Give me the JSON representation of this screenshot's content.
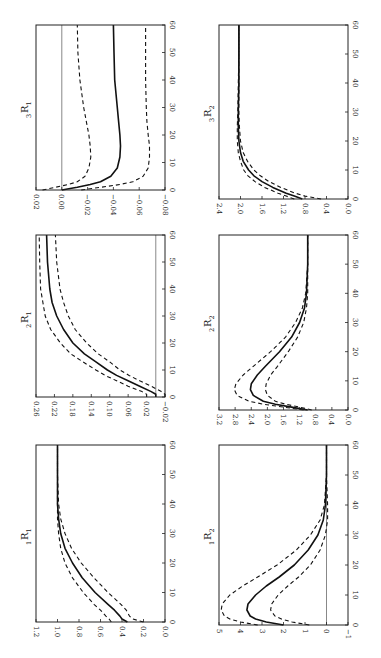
{
  "figure": {
    "orientation": "rotated 90 degrees counterclockwise",
    "colors": {
      "line": "#111111",
      "frame": "#222222",
      "background": "#ffffff",
      "reference_line": "#555555"
    },
    "line_styles": {
      "point_estimate": "solid",
      "confidence_band": "dashed"
    }
  },
  "chart_data": [
    {
      "id": "3R1",
      "title": "R",
      "title_prefix": "3",
      "title_suffix": "1",
      "type": "line",
      "xlabel": "",
      "ylabel": "",
      "x_ticks": [
        0,
        10,
        20,
        30,
        40,
        50,
        60
      ],
      "xlim": [
        0,
        60
      ],
      "y_ticks": [
        0.02,
        0.0,
        -0.02,
        -0.04,
        -0.06,
        -0.08
      ],
      "ylim": [
        -0.08,
        0.02
      ],
      "reference_line": 0.0,
      "x": [
        0,
        1,
        2,
        3,
        5,
        8,
        12,
        16,
        20,
        25,
        30,
        40,
        50,
        60
      ],
      "series": [
        {
          "name": "estimate",
          "style": "solid",
          "values": [
            0.0,
            -0.012,
            -0.022,
            -0.03,
            -0.038,
            -0.043,
            -0.045,
            -0.0455,
            -0.045,
            -0.044,
            -0.043,
            -0.041,
            -0.0405,
            -0.04
          ]
        },
        {
          "name": "upper",
          "style": "dashed",
          "values": [
            0.015,
            0.005,
            -0.005,
            -0.012,
            -0.018,
            -0.021,
            -0.0225,
            -0.022,
            -0.021,
            -0.019,
            -0.017,
            -0.014,
            -0.0125,
            -0.012
          ]
        },
        {
          "name": "lower",
          "style": "dashed",
          "values": [
            -0.015,
            -0.03,
            -0.045,
            -0.055,
            -0.063,
            -0.067,
            -0.068,
            -0.068,
            -0.067,
            -0.066,
            -0.0655,
            -0.065,
            -0.065,
            -0.065
          ]
        }
      ]
    },
    {
      "id": "2R1",
      "title": "R",
      "title_prefix": "2",
      "title_suffix": "1",
      "type": "line",
      "xlabel": "",
      "ylabel": "",
      "x_ticks": [
        0,
        10,
        20,
        30,
        40,
        50,
        60
      ],
      "xlim": [
        0,
        60
      ],
      "y_ticks": [
        0.26,
        0.22,
        0.18,
        0.14,
        0.1,
        0.06,
        0.02,
        -0.02
      ],
      "ylim": [
        -0.02,
        0.26
      ],
      "reference_line": 0.0,
      "x": [
        0,
        1,
        2,
        4,
        6,
        8,
        10,
        13,
        16,
        20,
        25,
        30,
        35,
        40,
        50,
        60
      ],
      "series": [
        {
          "name": "estimate",
          "style": "solid",
          "values": [
            0.0,
            0.0,
            0.01,
            0.035,
            0.06,
            0.085,
            0.105,
            0.13,
            0.155,
            0.18,
            0.2,
            0.215,
            0.225,
            0.23,
            0.235,
            0.237
          ]
        },
        {
          "name": "upper",
          "style": "dashed",
          "values": [
            0.02,
            0.02,
            0.03,
            0.06,
            0.085,
            0.11,
            0.13,
            0.158,
            0.185,
            0.207,
            0.228,
            0.24,
            0.245,
            0.25,
            0.252,
            0.253
          ]
        },
        {
          "name": "lower",
          "style": "dashed",
          "values": [
            -0.02,
            -0.02,
            -0.012,
            0.01,
            0.035,
            0.058,
            0.078,
            0.1,
            0.125,
            0.15,
            0.175,
            0.19,
            0.2,
            0.208,
            0.215,
            0.218
          ]
        }
      ]
    },
    {
      "id": "1R1",
      "title": "R",
      "title_prefix": "1",
      "title_suffix": "1",
      "type": "line",
      "xlabel": "",
      "ylabel": "",
      "x_ticks": [
        0,
        10,
        20,
        30,
        40,
        50,
        60
      ],
      "xlim": [
        0,
        60
      ],
      "y_ticks": [
        1.2,
        1.0,
        0.8,
        0.6,
        0.4,
        0.2,
        0.0
      ],
      "ylim": [
        0.0,
        1.2
      ],
      "x": [
        0,
        1,
        2,
        4,
        6,
        10,
        15,
        20,
        25,
        30,
        35,
        40,
        50,
        60
      ],
      "series": [
        {
          "name": "estimate",
          "style": "solid",
          "values": [
            0.35,
            0.4,
            0.42,
            0.47,
            0.53,
            0.65,
            0.77,
            0.86,
            0.93,
            0.97,
            0.99,
            1.0,
            1.0,
            1.0
          ]
        },
        {
          "name": "upper",
          "style": "dashed",
          "values": [
            0.5,
            0.52,
            0.55,
            0.6,
            0.66,
            0.76,
            0.86,
            0.93,
            0.97,
            0.99,
            1.0,
            1.0,
            1.0,
            1.0
          ]
        },
        {
          "name": "lower",
          "style": "dashed",
          "values": [
            0.2,
            0.3,
            0.33,
            0.36,
            0.41,
            0.53,
            0.66,
            0.78,
            0.87,
            0.93,
            0.97,
            0.99,
            1.0,
            1.0
          ]
        }
      ]
    },
    {
      "id": "3R2",
      "title": "R",
      "title_prefix": "3",
      "title_suffix": "2",
      "type": "line",
      "xlabel": "",
      "ylabel": "",
      "x_ticks": [
        0,
        10,
        20,
        30,
        40,
        50,
        60
      ],
      "xlim": [
        0,
        60
      ],
      "y_ticks": [
        2.4,
        2.0,
        1.6,
        1.2,
        0.8,
        0.4,
        0.0
      ],
      "ylim": [
        0.0,
        2.4
      ],
      "x": [
        0,
        1,
        2,
        4,
        6,
        8,
        10,
        13,
        16,
        20,
        25,
        30,
        40,
        50,
        60
      ],
      "series": [
        {
          "name": "estimate",
          "style": "solid",
          "values": [
            0.85,
            1.0,
            1.15,
            1.4,
            1.6,
            1.75,
            1.85,
            1.95,
            2.0,
            2.03,
            2.04,
            2.04,
            2.03,
            2.03,
            2.03
          ]
        },
        {
          "name": "upper",
          "style": "dashed",
          "values": [
            1.0,
            1.15,
            1.3,
            1.55,
            1.73,
            1.86,
            1.94,
            2.0,
            2.04,
            2.06,
            2.06,
            2.05,
            2.04,
            2.03,
            2.03
          ]
        },
        {
          "name": "lower",
          "style": "dashed",
          "values": [
            0.5,
            0.8,
            0.98,
            1.25,
            1.47,
            1.63,
            1.75,
            1.87,
            1.95,
            2.0,
            2.02,
            2.03,
            2.03,
            2.03,
            2.03
          ]
        }
      ]
    },
    {
      "id": "2R2",
      "title": "R",
      "title_prefix": "2",
      "title_suffix": "2",
      "type": "line",
      "xlabel": "",
      "ylabel": "",
      "x_ticks": [
        0,
        10,
        20,
        30,
        40,
        50,
        60
      ],
      "xlim": [
        0,
        60
      ],
      "y_ticks": [
        3.2,
        2.8,
        2.4,
        2.0,
        1.6,
        1.2,
        0.8,
        0.4,
        0.0
      ],
      "ylim": [
        0.0,
        3.2
      ],
      "x": [
        0,
        1,
        2,
        3,
        5,
        7,
        9,
        12,
        15,
        20,
        25,
        30,
        35,
        40,
        50,
        60
      ],
      "series": [
        {
          "name": "estimate",
          "style": "solid",
          "values": [
            1.0,
            1.4,
            1.8,
            2.1,
            2.35,
            2.42,
            2.4,
            2.25,
            2.05,
            1.7,
            1.4,
            1.2,
            1.08,
            1.03,
            1.0,
            1.0
          ]
        },
        {
          "name": "upper",
          "style": "dashed",
          "values": [
            1.1,
            1.6,
            2.1,
            2.45,
            2.75,
            2.82,
            2.78,
            2.6,
            2.35,
            1.92,
            1.55,
            1.3,
            1.13,
            1.05,
            1.0,
            1.0
          ]
        },
        {
          "name": "lower",
          "style": "dashed",
          "values": [
            0.9,
            1.2,
            1.55,
            1.8,
            2.0,
            2.05,
            2.03,
            1.92,
            1.75,
            1.48,
            1.25,
            1.1,
            1.03,
            1.0,
            1.0,
            1.0
          ]
        }
      ]
    },
    {
      "id": "1R2",
      "title": "R",
      "title_prefix": "1",
      "title_suffix": "2",
      "type": "line",
      "xlabel": "",
      "ylabel": "",
      "x_ticks": [
        0,
        10,
        20,
        30,
        40,
        50,
        60
      ],
      "xlim": [
        0,
        60
      ],
      "y_ticks": [
        5,
        4,
        3,
        2,
        1,
        0,
        -1
      ],
      "ylim": [
        -1,
        5
      ],
      "reference_line": 0,
      "x": [
        0,
        1,
        2,
        3,
        5,
        7,
        10,
        13,
        16,
        20,
        25,
        30,
        35,
        40,
        50,
        60
      ],
      "series": [
        {
          "name": "estimate",
          "style": "solid",
          "values": [
            2.0,
            2.8,
            3.3,
            3.55,
            3.7,
            3.65,
            3.3,
            2.8,
            2.2,
            1.5,
            0.85,
            0.4,
            0.15,
            0.05,
            0.0,
            0.0
          ]
        },
        {
          "name": "upper",
          "style": "dashed",
          "values": [
            3.2,
            4.0,
            4.5,
            4.75,
            4.9,
            4.85,
            4.5,
            3.9,
            3.2,
            2.3,
            1.4,
            0.75,
            0.3,
            0.1,
            0.0,
            0.0
          ]
        },
        {
          "name": "lower",
          "style": "dashed",
          "values": [
            0.8,
            1.6,
            2.1,
            2.4,
            2.6,
            2.55,
            2.25,
            1.8,
            1.3,
            0.75,
            0.3,
            0.05,
            -0.05,
            -0.05,
            0.0,
            0.0
          ]
        }
      ]
    }
  ],
  "layout": {
    "panels": [
      {
        "id": "3R1",
        "frame": [
          36,
          25,
          165,
          190
        ],
        "title_pos": [
          28,
          108
        ]
      },
      {
        "id": "2R1",
        "frame": [
          36,
          235,
          165,
          397
        ],
        "title_pos": [
          28,
          318
        ]
      },
      {
        "id": "1R1",
        "frame": [
          36,
          445,
          165,
          622
        ],
        "title_pos": [
          28,
          535
        ]
      },
      {
        "id": "3R2",
        "frame": [
          219,
          25,
          348,
          199
        ],
        "title_pos": [
          211,
          112
        ]
      },
      {
        "id": "2R2",
        "frame": [
          219,
          235,
          348,
          410
        ],
        "title_pos": [
          211,
          322
        ]
      },
      {
        "id": "1R2",
        "frame": [
          219,
          445,
          348,
          625
        ],
        "title_pos": [
          211,
          535
        ]
      }
    ]
  }
}
